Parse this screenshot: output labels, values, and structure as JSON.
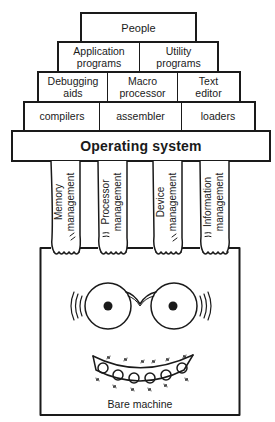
{
  "diagram": {
    "layers": [
      {
        "name": "people",
        "cells": [
          "People"
        ]
      },
      {
        "name": "applications",
        "cells": [
          "Application programs",
          "Utility programs"
        ]
      },
      {
        "name": "tools",
        "cells": [
          "Debugging aids",
          "Macro processor",
          "Text editor"
        ]
      },
      {
        "name": "translators",
        "cells": [
          "compilers",
          "assembler",
          "loaders"
        ]
      },
      {
        "name": "os",
        "cells": [
          "Operating system"
        ]
      }
    ],
    "people": "People",
    "app_programs_1": "Application",
    "app_programs_2": "programs",
    "utility_1": "Utility",
    "utility_2": "programs",
    "debugging_1": "Debugging",
    "debugging_2": "aids",
    "macro_1": "Macro",
    "macro_2": "processor",
    "text_1": "Text",
    "text_2": "editor",
    "compilers": "compilers",
    "assembler": "assembler",
    "loaders": "loaders",
    "operating_system": "Operating system",
    "arms": [
      {
        "line1": "Memory",
        "line2": "management"
      },
      {
        "line1": "Processor",
        "line2": "management"
      },
      {
        "line1": "Device",
        "line2": "management"
      },
      {
        "line1": "Information",
        "line2": "management"
      }
    ],
    "machine_label": "Bare machine",
    "line_color": "#1a1a1a",
    "background": "#ffffff"
  }
}
